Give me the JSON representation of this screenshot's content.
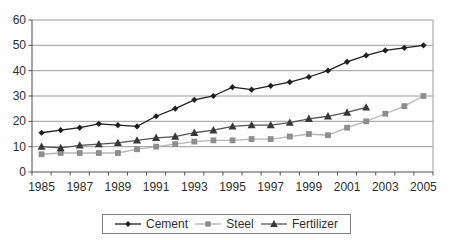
{
  "chart_data": {
    "type": "line",
    "title": "",
    "xlabel": "",
    "ylabel": "",
    "categories": [
      1985,
      1986,
      1987,
      1988,
      1989,
      1990,
      1991,
      1992,
      1993,
      1994,
      1995,
      1996,
      1997,
      1998,
      1999,
      2000,
      2001,
      2002,
      2003,
      2004,
      2005
    ],
    "x_tick_labels": [
      "1985",
      "1987",
      "1989",
      "1991",
      "1993",
      "1995",
      "1997",
      "1999",
      "2001",
      "2003",
      "2005"
    ],
    "ylim": [
      0,
      60
    ],
    "y_ticks": [
      0,
      10,
      20,
      30,
      40,
      50,
      60
    ],
    "grid": "horizontal",
    "legend_position": "bottom",
    "series": [
      {
        "name": "Cement",
        "marker": "diamond",
        "line_color": "#1f1f1f",
        "marker_color": "#1f1f1f",
        "values": [
          15.5,
          16.5,
          17.5,
          19,
          18.5,
          18,
          22,
          25,
          28.5,
          30,
          33.5,
          32.5,
          34,
          35.5,
          37.5,
          40,
          43.5,
          46,
          48,
          49,
          50
        ]
      },
      {
        "name": "Steel",
        "marker": "square",
        "line_color": "#b5b5b5",
        "marker_color": "#8e8e8e",
        "values": [
          7,
          7.5,
          7.5,
          7.5,
          7.5,
          9,
          10,
          11,
          12,
          12.5,
          12.5,
          13,
          13,
          14,
          15,
          14.5,
          17.5,
          20,
          23,
          26,
          30
        ]
      },
      {
        "name": "Fertilizer",
        "marker": "triangle",
        "line_color": "#555555",
        "marker_color": "#383838",
        "values": [
          10,
          9.5,
          10.5,
          11,
          11.5,
          12.5,
          13.5,
          14,
          15.5,
          16.5,
          18,
          18.5,
          18.5,
          19.5,
          21,
          22,
          23.5,
          25.5,
          null,
          null,
          null
        ]
      }
    ],
    "colors": {
      "grid": "#9c9c9c",
      "axis": "#4f4f4f",
      "text": "#2e2e2e",
      "background": "#fefefe"
    }
  }
}
